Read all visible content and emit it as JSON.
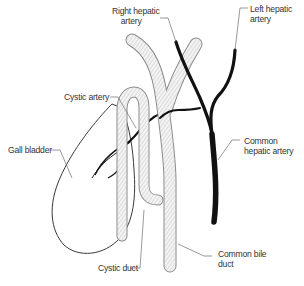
{
  "diagram": {
    "type": "anatomical-illustration",
    "labels": {
      "right_hepatic_artery": "Right hepatic\n    artery",
      "left_hepatic_artery": "Left hepatic\nartery",
      "cystic_artery": "Cystic artery",
      "gall_bladder": "Gall bladder",
      "common_hepatic_artery": "Common\nhepatic artery",
      "common_bile_duct": "Common bile\nduct",
      "cystic_duct": "Cystic duct"
    },
    "colors": {
      "artery": "#111111",
      "duct_outline": "#8a8a8a",
      "duct_fill": "#f4f4f4",
      "gallbladder_outline": "#222222",
      "leader_line": "#555555",
      "text": "#333333",
      "background": "#ffffff"
    }
  }
}
